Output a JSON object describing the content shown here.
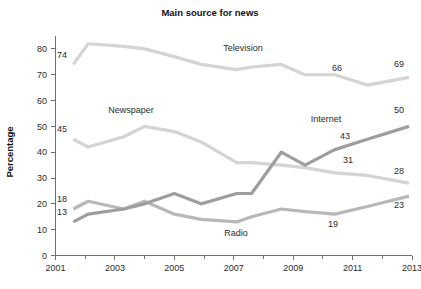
{
  "chart_data": {
    "type": "line",
    "title": "Main source for news",
    "xlabel": "",
    "ylabel": "Percentage",
    "xlim": [
      2001,
      2013
    ],
    "ylim": [
      0,
      85
    ],
    "yticks": [
      0,
      10,
      20,
      30,
      40,
      50,
      60,
      70,
      80
    ],
    "xticks": [
      2001,
      2003,
      2005,
      2007,
      2009,
      2011,
      2013
    ],
    "xminorticks": [
      2002,
      2004,
      2006,
      2008,
      2010,
      2012
    ],
    "grid": false,
    "legend_position": "inline-labels",
    "x": [
      2001.6,
      2002.1,
      2003.3,
      2004.0,
      2005.0,
      2005.9,
      2007.1,
      2007.6,
      2008.6,
      2009.4,
      2010.4,
      2011.5,
      2012.9
    ],
    "series": [
      {
        "name": "Television",
        "color": "#d4d4d4",
        "values": [
          74,
          82,
          81,
          80,
          77,
          74,
          72,
          73,
          74,
          70,
          70,
          66,
          69
        ],
        "label": "Television",
        "endpoint_labels": [
          {
            "text": "74",
            "value": 74,
            "x": 2001.6,
            "anchor": "left"
          },
          {
            "text": "66",
            "value": 66,
            "x": 2011.5,
            "anchor": "above"
          },
          {
            "text": "69",
            "value": 69,
            "x": 2012.9,
            "anchor": "above-right"
          }
        ]
      },
      {
        "name": "Newspaper",
        "color": "#d4d4d4",
        "values": [
          45,
          42,
          46,
          50,
          48,
          44,
          36,
          36,
          35,
          34,
          32,
          31,
          28
        ],
        "label": "Newspaper",
        "endpoint_labels": [
          {
            "text": "45",
            "value": 45,
            "x": 2001.6,
            "anchor": "left"
          },
          {
            "text": "31",
            "value": 31,
            "x": 2011.5,
            "anchor": "above"
          },
          {
            "text": "28",
            "value": 28,
            "x": 2012.9,
            "anchor": "above-right"
          }
        ]
      },
      {
        "name": "Internet",
        "color": "#9e9e9e",
        "values": [
          13,
          16,
          18,
          20,
          24,
          20,
          24,
          24,
          40,
          35,
          41,
          45,
          50
        ],
        "label": "Internet",
        "endpoint_labels": [
          {
            "text": "13",
            "value": 13,
            "x": 2001.6,
            "anchor": "left"
          },
          {
            "text": "43",
            "value": 43,
            "x": 2010.4,
            "anchor": "above"
          },
          {
            "text": "50",
            "value": 50,
            "x": 2012.9,
            "anchor": "above-right"
          }
        ]
      },
      {
        "name": "Radio",
        "color": "#b8b8b8",
        "values": [
          18,
          21,
          18,
          21,
          16,
          14,
          13,
          15,
          18,
          17,
          16,
          19,
          23
        ],
        "label": "Radio",
        "endpoint_labels": [
          {
            "text": "18",
            "value": 18,
            "x": 2001.6,
            "anchor": "left"
          },
          {
            "text": "19",
            "value": 19,
            "x": 2010.4,
            "anchor": "below"
          },
          {
            "text": "23",
            "value": 23,
            "x": 2012.9,
            "anchor": "below-right"
          }
        ]
      }
    ],
    "annotations": [
      {
        "text": "Television",
        "x_px": 243,
        "y_px": 51
      },
      {
        "text": "Newspaper",
        "x_px": 131,
        "y_px": 113
      },
      {
        "text": "Internet",
        "x_px": 326,
        "y_px": 122
      },
      {
        "text": "Radio",
        "x_px": 236,
        "y_px": 236
      },
      {
        "text": "74",
        "x_px": 62,
        "y_px": 58
      },
      {
        "text": "45",
        "x_px": 62,
        "y_px": 132
      },
      {
        "text": "18",
        "x_px": 62,
        "y_px": 202
      },
      {
        "text": "13",
        "x_px": 62,
        "y_px": 215
      },
      {
        "text": "66",
        "x_px": 337,
        "y_px": 71
      },
      {
        "text": "69",
        "x_px": 399,
        "y_px": 67
      },
      {
        "text": "43",
        "x_px": 345,
        "y_px": 139
      },
      {
        "text": "50",
        "x_px": 399,
        "y_px": 113
      },
      {
        "text": "31",
        "x_px": 348,
        "y_px": 163
      },
      {
        "text": "28",
        "x_px": 399,
        "y_px": 174
      },
      {
        "text": "19",
        "x_px": 333,
        "y_px": 227
      },
      {
        "text": "23",
        "x_px": 399,
        "y_px": 208
      }
    ]
  },
  "labels": {
    "title": "Main source for news",
    "ylabel": "Percentage"
  }
}
